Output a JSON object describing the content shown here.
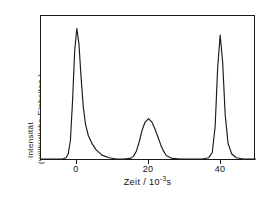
{
  "figure": {
    "background_color": "#ffffff",
    "line_color": "#1a1a1a",
    "frame_color": "#1a1a1a"
  },
  "axes": {
    "ylabel_line1": "Intensität",
    "ylabel_line2": "(willkürliche  Einheiten )",
    "xlabel_prefix": "Zeit / 10",
    "xlabel_exponent": "-3",
    "xlabel_suffix": "s",
    "xtick_labels": [
      "0",
      "20",
      "40"
    ]
  },
  "chart_data": {
    "type": "line",
    "title": "",
    "xlabel": "Zeit / 10^-3 s",
    "ylabel": "Intensität (willkürliche Einheiten)",
    "xlim": [
      -10,
      50
    ],
    "ylim": [
      0,
      1.05
    ],
    "xticks": [
      0,
      20,
      40
    ],
    "yticks": [],
    "grid": false,
    "legend": false,
    "series": [
      {
        "name": "Signal",
        "description": "Drei Peaks: scharfer Peak bei 0 mit Schwanz, breiter niedriger Peak bei 20, schmaler Peak bei 40",
        "peaks": [
          {
            "center": 0,
            "height": 1.0,
            "width": 2.0,
            "shape": "asymmetric-tailing"
          },
          {
            "center": 20,
            "height": 0.31,
            "width": 3.6,
            "shape": "broad-symmetric"
          },
          {
            "center": 40,
            "height": 0.95,
            "width": 1.3,
            "shape": "narrow-symmetric"
          }
        ],
        "x": [
          -10,
          -6,
          -4,
          -3,
          -2.4,
          -1.8,
          -1.2,
          -0.6,
          0,
          0.6,
          1.2,
          1.8,
          2.4,
          3.2,
          4.2,
          5.4,
          7,
          9,
          11,
          13,
          15,
          15.8,
          16.6,
          17.4,
          18.2,
          19,
          20,
          21,
          21.8,
          22.6,
          23.4,
          24.2,
          25,
          26.5,
          29,
          32,
          35,
          36.8,
          37.8,
          38.6,
          39.3,
          40,
          40.7,
          41.4,
          42.2,
          43.2,
          44.5,
          46.5,
          50
        ],
        "y": [
          0,
          0,
          0,
          0.01,
          0.04,
          0.14,
          0.44,
          0.83,
          1.0,
          0.88,
          0.62,
          0.4,
          0.27,
          0.18,
          0.12,
          0.07,
          0.03,
          0.01,
          0,
          0,
          0.005,
          0.02,
          0.06,
          0.13,
          0.22,
          0.28,
          0.31,
          0.28,
          0.23,
          0.17,
          0.11,
          0.06,
          0.025,
          0.005,
          0,
          0,
          0,
          0.01,
          0.05,
          0.25,
          0.7,
          0.95,
          0.74,
          0.34,
          0.12,
          0.04,
          0.01,
          0,
          0
        ]
      }
    ]
  }
}
